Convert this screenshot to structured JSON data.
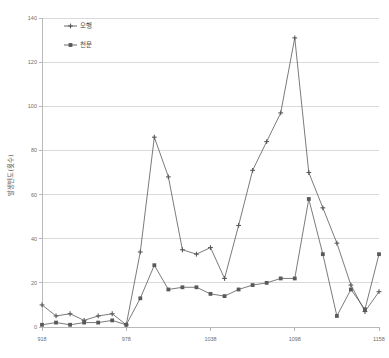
{
  "chart_data": {
    "type": "line",
    "title": "",
    "xlabel": "",
    "ylabel": "발생빈도(횟수)",
    "xlim": [
      918,
      1158
    ],
    "ylim": [
      0,
      140
    ],
    "ytick_values": [
      0,
      20,
      40,
      60,
      80,
      100,
      120,
      140
    ],
    "ytick_labels": [
      "0",
      "20",
      "40",
      "60",
      "80",
      "100",
      "120",
      "140"
    ],
    "xtick_values": [
      918,
      978,
      1038,
      1098,
      1158
    ],
    "xtick_labels": [
      "918",
      "978",
      "1038",
      "1098",
      "1158"
    ],
    "grid": "horizontal",
    "legend_position": "top-left",
    "x": [
      918,
      928,
      938,
      948,
      958,
      968,
      978,
      988,
      998,
      1008,
      1018,
      1028,
      1038,
      1048,
      1058,
      1068,
      1078,
      1088,
      1098,
      1108,
      1118,
      1128,
      1138,
      1148,
      1158
    ],
    "series": [
      {
        "name": "오행",
        "marker": "cross",
        "color": "#595959",
        "values": [
          10,
          5,
          6,
          3,
          5,
          6,
          1,
          34,
          86,
          68,
          35,
          33,
          36,
          22,
          46,
          71,
          84,
          97,
          131,
          70,
          54,
          38,
          19,
          7,
          16
        ]
      },
      {
        "name": "천문",
        "marker": "square",
        "color": "#595959",
        "values": [
          1,
          2,
          1,
          2,
          2,
          3,
          1,
          13,
          28,
          17,
          18,
          18,
          15,
          14,
          17,
          19,
          20,
          22,
          22,
          58,
          33,
          5,
          17,
          8,
          33
        ]
      }
    ]
  },
  "legend": {
    "items": [
      {
        "label": "오행"
      },
      {
        "label": "천문"
      }
    ]
  },
  "axes": {
    "y_title": "발생빈도(횟수)"
  }
}
